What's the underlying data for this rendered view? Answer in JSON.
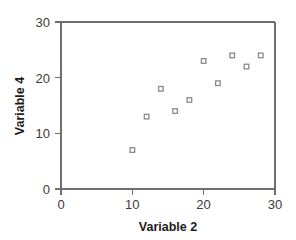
{
  "chart_data": {
    "type": "scatter",
    "title": "",
    "xlabel": "Variable 2",
    "ylabel": "Variable 4",
    "xlim": [
      0,
      30
    ],
    "ylim": [
      0,
      30
    ],
    "xticks": [
      0,
      10,
      20,
      30
    ],
    "yticks": [
      0,
      10,
      20,
      30
    ],
    "xtick_labels": [
      "0",
      "10",
      "20",
      "30"
    ],
    "ytick_labels": [
      "0",
      "10",
      "20",
      "30"
    ],
    "grid": false,
    "legend": null,
    "marker": "open-square",
    "marker_color": "#8a8a8a",
    "points": [
      {
        "x": 10,
        "y": 7
      },
      {
        "x": 12,
        "y": 13
      },
      {
        "x": 14,
        "y": 18
      },
      {
        "x": 16,
        "y": 14
      },
      {
        "x": 18,
        "y": 16
      },
      {
        "x": 20,
        "y": 23
      },
      {
        "x": 22,
        "y": 19
      },
      {
        "x": 24,
        "y": 24
      },
      {
        "x": 26,
        "y": 22
      },
      {
        "x": 28,
        "y": 24
      }
    ]
  },
  "axes": {
    "x_title": "Variable 2",
    "y_title": "Variable 4"
  },
  "colors": {
    "axis": "#6e6e6e",
    "text": "#1c1c1c",
    "tick_text": "#3b3b3b",
    "marker_stroke": "#8a8a8a",
    "background": "#ffffff"
  }
}
